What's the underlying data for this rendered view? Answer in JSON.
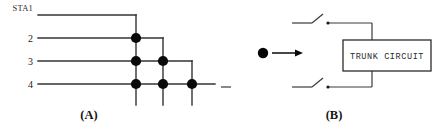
{
  "figure": {
    "width": 437,
    "height": 126,
    "background": "#ffffff",
    "line_color": "#333333",
    "dot_color": "#0a0a0a",
    "text_color": "#222222"
  },
  "panel_a": {
    "caption": "(A)",
    "description": "triangular crosspoint switching matrix",
    "station_labels": [
      {
        "text": "STA1",
        "y": 15
      },
      {
        "text": "2",
        "y": 38
      },
      {
        "text": "3",
        "y": 61
      },
      {
        "text": "4",
        "y": 84
      }
    ],
    "row_ys": [
      15,
      38,
      61,
      84
    ],
    "column_xs": [
      136,
      163,
      192
    ],
    "crosspoints": [
      {
        "col": 0,
        "row": 1,
        "x": 136,
        "y": 38
      },
      {
        "col": 0,
        "row": 2,
        "x": 136,
        "y": 61
      },
      {
        "col": 0,
        "row": 3,
        "x": 136,
        "y": 84
      },
      {
        "col": 1,
        "row": 2,
        "x": 163,
        "y": 61
      },
      {
        "col": 1,
        "row": 3,
        "x": 163,
        "y": 84
      },
      {
        "col": 2,
        "row": 3,
        "x": 192,
        "y": 84
      }
    ],
    "line_start_x": 38,
    "dot_radius": 5.1
  },
  "panel_b": {
    "caption": "(B)",
    "trunk_label": "TRUNK CIRCUIT",
    "upper_switch": {
      "y": 23,
      "label": "open-contact"
    },
    "lower_switch": {
      "y": 87,
      "label": "open-contact"
    },
    "source_dot": {
      "x": 263,
      "y": 53
    },
    "arrow": {
      "from_x": 272,
      "to_x": 302,
      "y": 53
    },
    "box": {
      "x": 343,
      "y": 40,
      "width": 88,
      "height": 31
    }
  }
}
